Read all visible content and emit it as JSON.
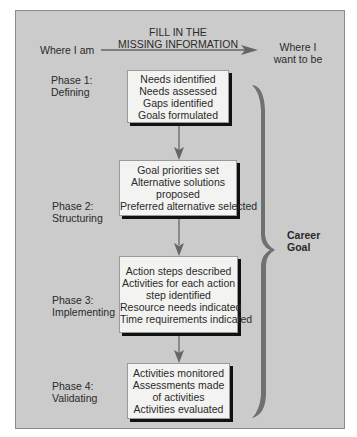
{
  "header": {
    "left_label": "Where I am",
    "center_label_lines": [
      "FILL IN THE",
      "MISSING INFORMATION"
    ],
    "right_label_lines": [
      "Where I",
      "want to be"
    ]
  },
  "phases": [
    {
      "label_lines": [
        "Phase 1:",
        "Defining"
      ],
      "box_lines": [
        "Needs identified",
        "Needs assessed",
        "Gaps identified",
        "Goals formulated"
      ]
    },
    {
      "label_lines": [
        "Phase 2:",
        "Structuring"
      ],
      "box_lines": [
        "Goal priorities set",
        "Alternative solutions",
        "proposed",
        "Preferred alternative selected"
      ]
    },
    {
      "label_lines": [
        "Phase 3:",
        "Implementing"
      ],
      "box_lines": [
        "Action steps described",
        "Activities for each action",
        "step identified",
        "Resource needs indicated",
        "Time requirements indicated"
      ]
    },
    {
      "label_lines": [
        "Phase 4:",
        "Validating"
      ],
      "box_lines": [
        "Activities monitored",
        "Assessments made",
        "of activities",
        "Activities evaluated"
      ]
    }
  ],
  "brace": {
    "label_lines": [
      "Career",
      "Goal"
    ]
  },
  "colors": {
    "panel_bg": "#cbcbcb",
    "box_bg": "#f3f3f1",
    "arrow": "#6b6b6b",
    "brace": "#707070",
    "shadow": "#111111"
  }
}
